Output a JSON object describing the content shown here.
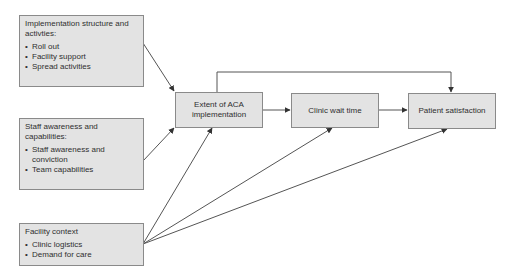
{
  "colors": {
    "box_fill": "#e3e3e3",
    "box_border": "#8a8a8a",
    "line": "#555555",
    "text": "#2f2f2f"
  },
  "factors": [
    {
      "title": "Implementation structure and activties:",
      "items": [
        "Roll out",
        "Facility support",
        "Spread activities"
      ]
    },
    {
      "title": "Staff awareness and capabilities:",
      "items": [
        "Staff awareness and conviction",
        "Team capabilities"
      ]
    },
    {
      "title": "Facility context",
      "items": [
        "Clinic logistics",
        "Demand for care"
      ]
    }
  ],
  "outcomes": [
    {
      "label": "Extent of ACA implementation"
    },
    {
      "label": "Clinic wait time"
    },
    {
      "label": "Patient satisfaction"
    }
  ],
  "edges": [
    {
      "from": "Implementation structure and activties",
      "to": "Extent of ACA implementation"
    },
    {
      "from": "Staff awareness and capabilities",
      "to": "Extent of ACA implementation"
    },
    {
      "from": "Facility context",
      "to": "Extent of ACA implementation"
    },
    {
      "from": "Facility context",
      "to": "Clinic wait time"
    },
    {
      "from": "Facility context",
      "to": "Patient satisfaction"
    },
    {
      "from": "Extent of ACA implementation",
      "to": "Clinic wait time"
    },
    {
      "from": "Clinic wait time",
      "to": "Patient satisfaction"
    },
    {
      "from": "Extent of ACA implementation",
      "to": "Patient satisfaction"
    }
  ]
}
